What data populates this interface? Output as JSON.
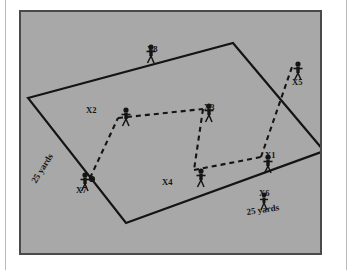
{
  "figure": {
    "kind": "soccer-drill-diagram",
    "background_color": "#a8a8a8",
    "border_color": "#4a4a4a",
    "line_color": "#141414",
    "field_shape": "quadrilateral",
    "dimension_labels": [
      {
        "id": "yards-left",
        "text": "25 yards",
        "rotation_deg": -58,
        "x": 36,
        "y": 178
      },
      {
        "id": "yards-bottom",
        "text": "25 yards",
        "rotation_deg": -8,
        "x": 247,
        "y": 207
      }
    ],
    "players": [
      {
        "id": "X1",
        "label": "X1",
        "px": 247,
        "py": 152,
        "label_x": 262,
        "label_y": 148,
        "has_ball": false
      },
      {
        "id": "X2",
        "label": "X2",
        "px": 105,
        "py": 105,
        "label_x": 83,
        "label_y": 103,
        "has_ball": false
      },
      {
        "id": "X3",
        "label": "X3",
        "px": 188,
        "py": 101,
        "label_x": 201,
        "label_y": 100,
        "has_ball": false
      },
      {
        "id": "X4",
        "label": "X4",
        "px": 180,
        "py": 166,
        "label_x": 159,
        "label_y": 175,
        "has_ball": false
      },
      {
        "id": "X5",
        "label": "X5",
        "px": 277,
        "py": 59,
        "label_x": 289,
        "label_y": 75,
        "has_ball": false
      },
      {
        "id": "X6",
        "label": "X6",
        "px": 243,
        "py": 190,
        "label_x": 256,
        "label_y": 186,
        "has_ball": false
      },
      {
        "id": "X7",
        "label": "X7",
        "px": 64,
        "py": 170,
        "label_x": 73,
        "label_y": 184,
        "has_ball": true
      },
      {
        "id": "X8",
        "label": "X8",
        "px": 130,
        "py": 42,
        "label_x": 144,
        "label_y": 43,
        "has_ball": false
      }
    ],
    "ball": {
      "x": 74,
      "y": 175,
      "r": 3
    },
    "passes": [
      {
        "from": "X7",
        "to": "X2"
      },
      {
        "from": "X2",
        "to": "X3"
      },
      {
        "from": "X3",
        "to": "X4"
      },
      {
        "from": "X4",
        "to": "X1"
      },
      {
        "from": "X1",
        "to": "X5"
      }
    ]
  }
}
